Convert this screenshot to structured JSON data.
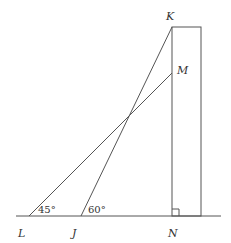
{
  "diagram": {
    "points": {
      "K": {
        "label": "K",
        "x": 172,
        "y": 27
      },
      "M": {
        "label": "M",
        "x": 172,
        "y": 73
      },
      "L": {
        "label": "L",
        "x": 29,
        "y": 216
      },
      "J": {
        "label": "J",
        "x": 81,
        "y": 216
      },
      "N": {
        "label": "N",
        "x": 172,
        "y": 216
      }
    },
    "angles": {
      "L": "45°",
      "J": "60°"
    },
    "colors": {
      "stroke": "#555555",
      "text": "#333333"
    }
  }
}
